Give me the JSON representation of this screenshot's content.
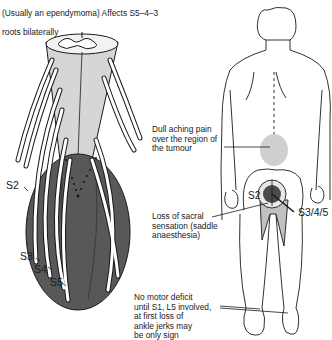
{
  "caption": {
    "line1": "(Usually an ependymoma) Affects S5–4–3",
    "line2": "roots bilaterally"
  },
  "left_figure": {
    "name": "Spinal cord with conus tumour and sacral nerve roots",
    "root_labels": [
      "S2",
      "S3",
      "S4",
      "S5"
    ],
    "colors": {
      "cord": "#d4d4d4",
      "tumour": "#555555",
      "outline": "#1a1a1a"
    }
  },
  "right_figure": {
    "name": "Posterior view of human body",
    "dermatome_labels": {
      "s2": "S2",
      "s345": "S3/4/5"
    },
    "colors": {
      "saddle": "#bdbdbd",
      "core": "#4a4a4a",
      "pain_area": "#c8c8c8"
    }
  },
  "annotations": {
    "pain": "Dull aching pain\nover the region of\nthe tumour",
    "sensation": "Loss of sacral\nsensation (saddle\nanaesthesia)",
    "motor": "No motor deficit\nuntil S1, L5 involved,\nat first loss of\nankle jerks may\nbe only sign"
  }
}
